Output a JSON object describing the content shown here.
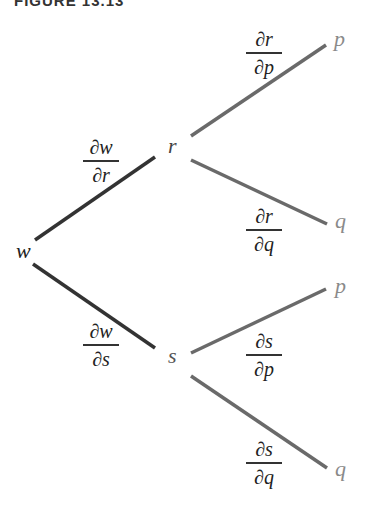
{
  "caption": "FIGURE 13.13",
  "colors": {
    "primary_edge": "#333333",
    "secondary_edge": "#6a6a6a",
    "root_node": "#222222",
    "mid_node": "#555555",
    "leaf_node": "#8a8a8a"
  },
  "nodes": {
    "root": "w",
    "mid_top": "r",
    "mid_bottom": "s",
    "leaf_r_p": "p",
    "leaf_r_q": "q",
    "leaf_s_p": "p",
    "leaf_s_q": "q"
  },
  "edges": [
    {
      "from": "w",
      "to": "r",
      "label_num": "∂w",
      "label_den": "∂r"
    },
    {
      "from": "w",
      "to": "s",
      "label_num": "∂w",
      "label_den": "∂s"
    },
    {
      "from": "r",
      "to": "p",
      "label_num": "∂r",
      "label_den": "∂p"
    },
    {
      "from": "r",
      "to": "q",
      "label_num": "∂r",
      "label_den": "∂q"
    },
    {
      "from": "s",
      "to": "p",
      "label_num": "∂s",
      "label_den": "∂p"
    },
    {
      "from": "s",
      "to": "q",
      "label_num": "∂s",
      "label_den": "∂q"
    }
  ]
}
